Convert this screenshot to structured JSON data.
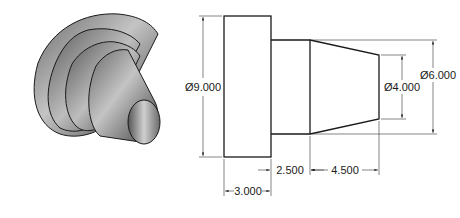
{
  "figure": {
    "type": "technical-drawing",
    "views": [
      "isometric-shaded",
      "orthographic-side"
    ],
    "colors": {
      "line": "#1a1a1a",
      "shade_dark": "#4a4a4a",
      "shade_light": "#c8c8c8",
      "background": "#ffffff"
    }
  },
  "dimensions": {
    "dia_large": "Ø9.000",
    "dia_mid": "Ø6.000",
    "dia_small": "Ø4.000",
    "len_flange": "3.000",
    "len_shoulder": "2.500",
    "len_taper": "4.500"
  }
}
